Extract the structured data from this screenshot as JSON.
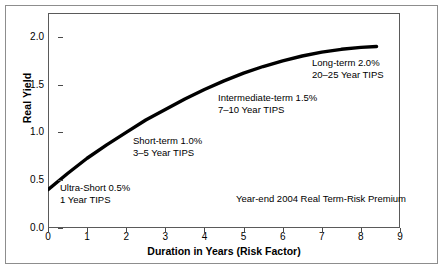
{
  "chart_data": {
    "type": "line",
    "title": "",
    "xlabel": "Duration in Years (Risk Factor)",
    "ylabel": "Real Yield",
    "xlim": [
      0,
      9
    ],
    "ylim": [
      0,
      2.25
    ],
    "grid": false,
    "legend": "none",
    "xticks": [
      "0",
      "1",
      "2",
      "3",
      "4",
      "5",
      "6",
      "7",
      "8",
      "9"
    ],
    "xtick_values": [
      0,
      1,
      2,
      3,
      4,
      5,
      6,
      7,
      8,
      9
    ],
    "yticks": [
      "0.0",
      "0.5",
      "1.0",
      "1.5",
      "2.0"
    ],
    "ytick_values": [
      0.0,
      0.5,
      1.0,
      1.5,
      2.0
    ],
    "series": [
      {
        "name": "Real yield curve",
        "x": [
          0.0,
          0.5,
          1.0,
          1.5,
          2.0,
          2.5,
          3.0,
          3.5,
          4.0,
          4.5,
          5.0,
          5.5,
          6.0,
          6.5,
          7.0,
          7.5,
          8.0,
          8.4
        ],
        "values": [
          0.4,
          0.57,
          0.73,
          0.87,
          1.0,
          1.13,
          1.24,
          1.35,
          1.45,
          1.54,
          1.62,
          1.69,
          1.75,
          1.8,
          1.84,
          1.87,
          1.89,
          1.9
        ]
      }
    ],
    "annotations": [
      {
        "name": "ultra-short",
        "line1": "Ultra-Short 0.5%",
        "line2": "1 Year TIPS",
        "x_px": 60,
        "y_px": 182
      },
      {
        "name": "short-term",
        "line1": "Short-term 1.0%",
        "line2": "3–5 Year TIPS",
        "x_px": 133,
        "y_px": 135
      },
      {
        "name": "intermediate-term",
        "line1": "Intermediate-term 1.5%",
        "line2": "7–10 Year TIPS",
        "x_px": 218,
        "y_px": 92
      },
      {
        "name": "long-term",
        "line1": "Long-term 2.0%",
        "line2": "20–25 Year TIPS",
        "x_px": 312,
        "y_px": 57
      }
    ],
    "caption": "Year-end 2004 Real Term-Risk Premium",
    "colors": {
      "curve": "#000000",
      "frame": "#5a5a5a",
      "outer_frame": "#8d8d8d",
      "text": "#000000",
      "background": "#ffffff"
    }
  }
}
